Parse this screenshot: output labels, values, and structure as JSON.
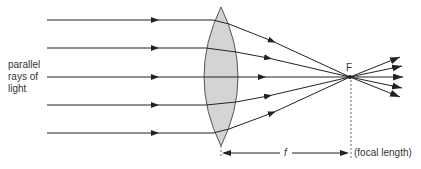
{
  "diagram": {
    "labels": {
      "rays_line1": "parallel",
      "rays_line2": "rays of",
      "rays_line3": "light",
      "focal_point": "F",
      "focal_symbol": "f",
      "focal_length": "(focal length)"
    },
    "colors": {
      "ray": "#222222",
      "lens_fill": "#d4d4d4",
      "lens_stroke": "#555555",
      "text": "#333333"
    },
    "geometry": {
      "ray_y": [
        20,
        48,
        77,
        105,
        133
      ],
      "lens_center_x": 221,
      "focus": [
        350,
        77
      ],
      "out_tips_y": [
        58,
        66,
        77,
        88,
        97
      ]
    }
  }
}
